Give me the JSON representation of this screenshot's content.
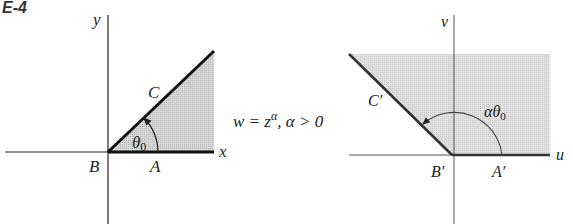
{
  "figure_label": "E-4",
  "left_plane": {
    "axis_x": "x",
    "axis_y": "y",
    "point_B": "B",
    "point_A": "A",
    "point_C": "C",
    "angle": "θ",
    "angle_sub": "0"
  },
  "mapping": {
    "lhs": "w = z",
    "exponent": "α",
    "condition": ", α > 0"
  },
  "right_plane": {
    "axis_u": "u",
    "axis_v": "v",
    "point_B": "B′",
    "point_A": "A′",
    "point_C": "C′",
    "angle": "αθ",
    "angle_sub": "0"
  },
  "colors": {
    "shade": "#cfcfcf",
    "line": "#111111",
    "axis": "#333333"
  }
}
